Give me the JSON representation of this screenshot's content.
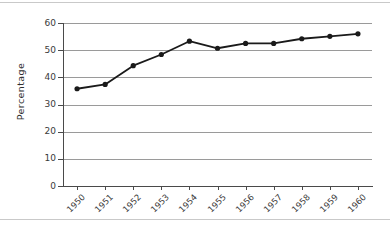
{
  "chart_data": {
    "type": "line",
    "title": "",
    "xlabel": "",
    "ylabel": "Percentage",
    "categories": [
      "1950",
      "1951",
      "1952",
      "1953",
      "1954",
      "1955",
      "1956",
      "1957",
      "1958",
      "1959",
      "1960"
    ],
    "values": [
      35.8,
      37.4,
      44.3,
      48.4,
      53.3,
      50.7,
      52.5,
      52.5,
      54.2,
      55.1,
      56.0
    ],
    "series": [
      {
        "name": "Percentage",
        "values": [
          35.8,
          37.4,
          44.3,
          48.4,
          53.3,
          50.7,
          52.5,
          52.5,
          54.2,
          55.1,
          56.0
        ]
      }
    ],
    "ylim": [
      0,
      60
    ],
    "yticks": [
      0,
      10,
      20,
      30,
      40,
      50,
      60
    ],
    "ytick_labels": [
      "0",
      "10",
      "20",
      "30",
      "40",
      "50",
      "60"
    ],
    "grid": true,
    "grid_axis": "y",
    "legend": false,
    "legend_position": "none",
    "marker": "filled-circle",
    "line_color": "#1a1a1a",
    "marker_color": "#1a1a1a",
    "gridline_color": "#9a9a9a",
    "axis_color": "#4a4a4a",
    "background_color": "#ffffff",
    "x_tick_label_rotation": -45
  },
  "axes": {
    "y_title": "Percentage"
  }
}
